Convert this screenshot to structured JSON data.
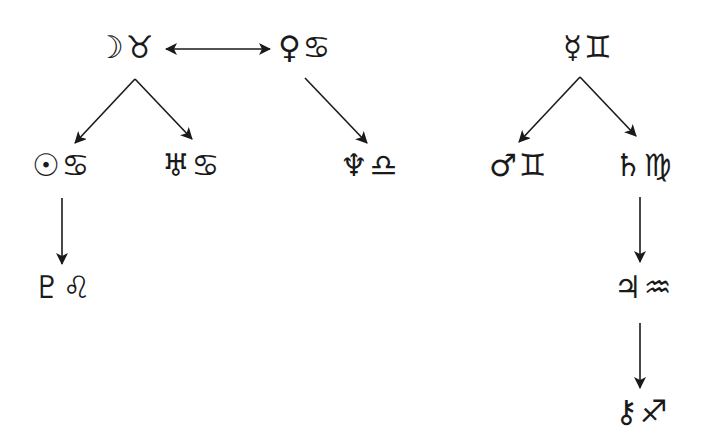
{
  "diagram": {
    "type": "astrological-dispositor-tree",
    "colors": {
      "ink": "#1a1a1a",
      "background": "#ffffff"
    },
    "nodes": [
      {
        "id": "moon-taurus",
        "planet": "Moon",
        "sign": "Taurus",
        "planet_glyph": "☽",
        "sign_glyph": "♉",
        "x": 96,
        "y": 32
      },
      {
        "id": "venus-cancer",
        "planet": "Venus",
        "sign": "Cancer",
        "planet_glyph": "♀",
        "sign_glyph": "♋",
        "x": 278,
        "y": 32
      },
      {
        "id": "mercury-gemini",
        "planet": "Mercury",
        "sign": "Gemini",
        "planet_glyph": "☿",
        "sign_glyph": "♊",
        "x": 563,
        "y": 32
      },
      {
        "id": "sun-cancer",
        "planet": "Sun",
        "sign": "Cancer",
        "planet_glyph": "☉",
        "sign_glyph": "♋",
        "x": 32,
        "y": 150
      },
      {
        "id": "uranus-cancer",
        "planet": "Uranus",
        "sign": "Cancer",
        "planet_glyph": "♅",
        "sign_glyph": "♋",
        "x": 162,
        "y": 150
      },
      {
        "id": "neptune-libra",
        "planet": "Neptune",
        "sign": "Libra",
        "planet_glyph": "♆",
        "sign_glyph": "♎",
        "x": 340,
        "y": 150
      },
      {
        "id": "mars-gemini",
        "planet": "Mars",
        "sign": "Gemini",
        "planet_glyph": "♂",
        "sign_glyph": "♊",
        "x": 489,
        "y": 150
      },
      {
        "id": "saturn-virgo",
        "planet": "Saturn",
        "sign": "Virgo",
        "planet_glyph": "♄",
        "sign_glyph": "♍",
        "x": 614,
        "y": 150
      },
      {
        "id": "pluto-leo",
        "planet": "Pluto",
        "sign": "Leo",
        "planet_glyph": "♇",
        "sign_glyph": "♌",
        "x": 33,
        "y": 272
      },
      {
        "id": "jupiter-aquarius",
        "planet": "Jupiter",
        "sign": "Aquarius",
        "planet_glyph": "♃",
        "sign_glyph": "♒",
        "x": 614,
        "y": 272
      },
      {
        "id": "chiron-sagittarius",
        "planet": "Chiron",
        "sign": "Sagittarius",
        "planet_glyph": "⚷",
        "sign_glyph": "♐",
        "x": 615,
        "y": 396
      }
    ],
    "edges": [
      {
        "from": "moon-taurus",
        "to": "venus-cancer",
        "type": "mutual-reception",
        "x1": 166,
        "y1": 49,
        "x2": 270,
        "y2": 49,
        "double": true
      },
      {
        "from": "moon-taurus",
        "to": "sun-cancer",
        "x1": 135,
        "y1": 79,
        "x2": 75,
        "y2": 143
      },
      {
        "from": "moon-taurus",
        "to": "uranus-cancer",
        "x1": 135,
        "y1": 79,
        "x2": 192,
        "y2": 139
      },
      {
        "from": "venus-cancer",
        "to": "neptune-libra",
        "x1": 305,
        "y1": 78,
        "x2": 367,
        "y2": 143
      },
      {
        "from": "mercury-gemini",
        "to": "mars-gemini",
        "x1": 580,
        "y1": 77,
        "x2": 519,
        "y2": 142
      },
      {
        "from": "mercury-gemini",
        "to": "saturn-virgo",
        "x1": 580,
        "y1": 77,
        "x2": 636,
        "y2": 136
      },
      {
        "from": "sun-cancer",
        "to": "pluto-leo",
        "x1": 62,
        "y1": 198,
        "x2": 62,
        "y2": 264
      },
      {
        "from": "saturn-virgo",
        "to": "jupiter-aquarius",
        "x1": 640,
        "y1": 197,
        "x2": 640,
        "y2": 262
      },
      {
        "from": "jupiter-aquarius",
        "to": "chiron-sagittarius",
        "x1": 640,
        "y1": 323,
        "x2": 640,
        "y2": 388
      }
    ]
  }
}
